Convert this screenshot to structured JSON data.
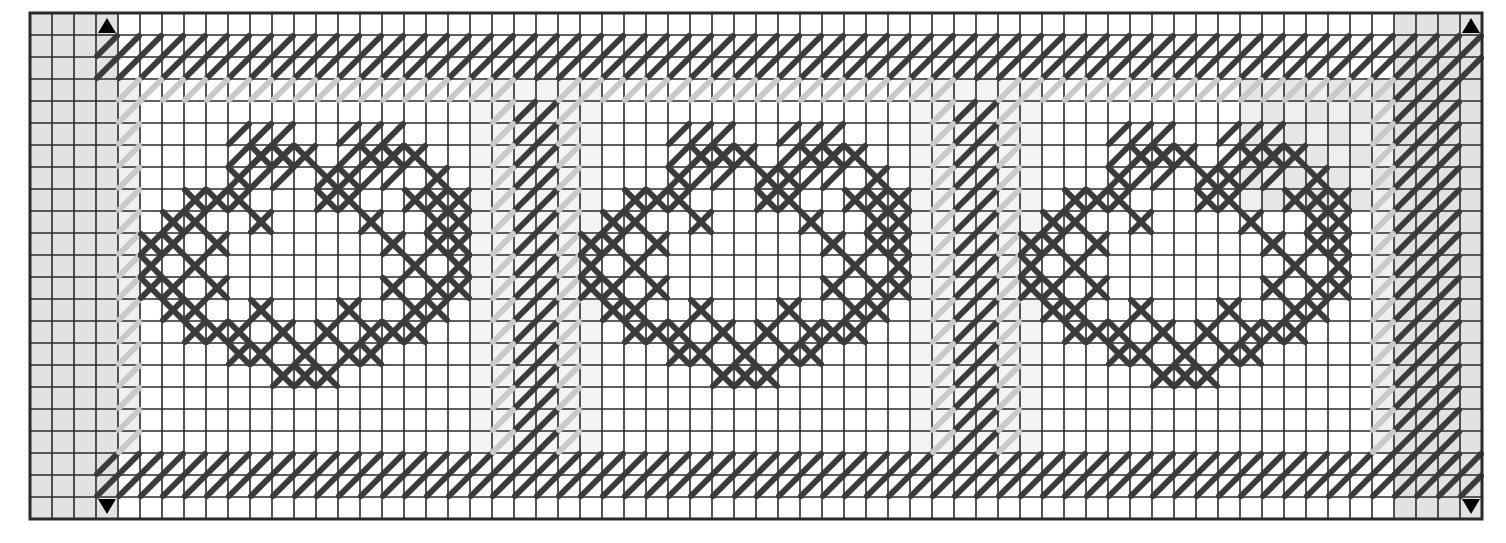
{
  "chart_title": "Needlepoint / Cross-Stitch Pattern Chart",
  "chart_data": {
    "type": "heatmap",
    "subtitle": "Repeating rosette border band with diagonal half-stitch borders",
    "xlabel": "",
    "ylabel": "",
    "grid": true,
    "legend_position": "none",
    "columns": 66,
    "rows": 23,
    "cell_px": 22,
    "origin": {
      "x": 30,
      "y": 13
    },
    "xlim": [
      0,
      66
    ],
    "ylim": [
      0,
      23
    ],
    "tick_labels_x": [],
    "tick_labels_y": [],
    "annotations": [
      {
        "name": "center-marker-top-left",
        "symbol": "triangle-up",
        "col": 3,
        "row": 0,
        "edge": "top"
      },
      {
        "name": "center-marker-top-right",
        "symbol": "triangle-up",
        "col": 65,
        "row": 0,
        "edge": "top"
      },
      {
        "name": "center-marker-bottom-left",
        "symbol": "triangle-up",
        "col": 3,
        "row": 22,
        "edge": "bottom"
      },
      {
        "name": "center-marker-bottom-right",
        "symbol": "triangle-up",
        "col": 65,
        "row": 22,
        "edge": "bottom"
      }
    ],
    "symbols": {
      "half_stitch_slash": {
        "label": "half stitch (/)",
        "color": "#3b3b3b"
      },
      "cross_stitch": {
        "label": "full cross stitch (X)",
        "color": "#3b3b3b"
      },
      "ghost_half_stitch": {
        "label": "faded / optional half stitch",
        "color": "#c9c9c9"
      }
    },
    "palette": {
      "grid_line": "#2a2a2a",
      "stitch_dark": "#3b3b3b",
      "stitch_ghost": "#c9c9c9",
      "shade_margin": "#e2e2e2",
      "shade_light": "#efefef",
      "background": "#ffffff",
      "marker": "#000000"
    },
    "shaded_regions": [
      {
        "name": "left-margin-band",
        "col0": 0,
        "row0": 0,
        "col1": 4,
        "row1": 23,
        "color": "#e2e2e2"
      },
      {
        "name": "right-margin-band",
        "col0": 62,
        "row0": 0,
        "col1": 66,
        "row1": 23,
        "color": "#e2e2e2"
      },
      {
        "name": "left-soft-edge",
        "col0": 4,
        "row0": 3,
        "col1": 5,
        "row1": 20,
        "color": "#efefef"
      },
      {
        "name": "right-soft-edge",
        "col0": 61,
        "row0": 3,
        "col1": 62,
        "row1": 20,
        "color": "#efefef"
      },
      {
        "name": "divider-1-halo",
        "col0": 20,
        "row0": 3,
        "col1": 26,
        "row1": 20,
        "color": "#f4f4f4"
      },
      {
        "name": "divider-2-halo",
        "col0": 40,
        "row0": 3,
        "col1": 46,
        "row1": 20,
        "color": "#f4f4f4"
      },
      {
        "name": "upper-right-checker",
        "col0": 55,
        "row0": 3,
        "col1": 62,
        "row1": 9,
        "color": "#efefef"
      }
    ],
    "bands": [
      {
        "name": "top-border-band",
        "row0": 1,
        "row1": 3,
        "col0": 3,
        "col1": 66,
        "stitch": "half_stitch_slash"
      },
      {
        "name": "bottom-border-band",
        "row0": 20,
        "row1": 22,
        "col0": 3,
        "col1": 66,
        "stitch": "half_stitch_slash"
      },
      {
        "name": "right-border-band",
        "col0": 62,
        "col1": 65,
        "row0": 3,
        "row1": 21,
        "stitch": "half_stitch_slash"
      },
      {
        "name": "divider-band-1",
        "col0": 22,
        "col1": 24,
        "row0": 4,
        "row1": 20,
        "stitch": "half_stitch_slash"
      },
      {
        "name": "divider-band-2",
        "col0": 42,
        "col1": 44,
        "row0": 4,
        "row1": 20,
        "stitch": "half_stitch_slash"
      }
    ],
    "motifs": [
      {
        "name": "rosette-motif-1",
        "center_col": 12.5,
        "center_row": 11.5,
        "width": 13,
        "height": 12
      },
      {
        "name": "rosette-motif-2",
        "center_col": 32.5,
        "center_row": 11.5,
        "width": 13,
        "height": 12
      },
      {
        "name": "rosette-motif-3",
        "center_col": 52.5,
        "center_row": 11.5,
        "width": 13,
        "height": 12
      }
    ],
    "motif_template": {
      "description": "13x12 rosette: outer ring of cross stitches, two diagonal half-stitch 'ear' blocks at top, open center",
      "cross_cells": [
        [
          5,
          1
        ],
        [
          6,
          1
        ],
        [
          7,
          1
        ],
        [
          10,
          1
        ],
        [
          11,
          1
        ],
        [
          12,
          1
        ],
        [
          4,
          2
        ],
        [
          8,
          2
        ],
        [
          9,
          2
        ],
        [
          13,
          2
        ],
        [
          2,
          3
        ],
        [
          3,
          3
        ],
        [
          4,
          3
        ],
        [
          8,
          3
        ],
        [
          9,
          3
        ],
        [
          12,
          3
        ],
        [
          13,
          3
        ],
        [
          14,
          3
        ],
        [
          1,
          4
        ],
        [
          2,
          4
        ],
        [
          5,
          4
        ],
        [
          10,
          4
        ],
        [
          13,
          4
        ],
        [
          14,
          4
        ],
        [
          0,
          5
        ],
        [
          1,
          5
        ],
        [
          3,
          5
        ],
        [
          11,
          5
        ],
        [
          13,
          5
        ],
        [
          14,
          5
        ],
        [
          0,
          6
        ],
        [
          2,
          6
        ],
        [
          12,
          6
        ],
        [
          14,
          6
        ],
        [
          0,
          7
        ],
        [
          1,
          7
        ],
        [
          3,
          7
        ],
        [
          11,
          7
        ],
        [
          13,
          7
        ],
        [
          14,
          7
        ],
        [
          1,
          8
        ],
        [
          2,
          8
        ],
        [
          5,
          8
        ],
        [
          9,
          8
        ],
        [
          12,
          8
        ],
        [
          13,
          8
        ],
        [
          2,
          9
        ],
        [
          3,
          9
        ],
        [
          4,
          9
        ],
        [
          6,
          9
        ],
        [
          8,
          9
        ],
        [
          10,
          9
        ],
        [
          11,
          9
        ],
        [
          12,
          9
        ],
        [
          4,
          10
        ],
        [
          5,
          10
        ],
        [
          7,
          10
        ],
        [
          9,
          10
        ],
        [
          10,
          10
        ],
        [
          6,
          11
        ],
        [
          7,
          11
        ],
        [
          8,
          11
        ]
      ],
      "half_cells": [
        [
          4,
          0
        ],
        [
          5,
          0
        ],
        [
          6,
          0
        ],
        [
          9,
          0
        ],
        [
          10,
          0
        ],
        [
          11,
          0
        ],
        [
          4,
          1
        ],
        [
          5,
          1
        ],
        [
          6,
          1
        ],
        [
          9,
          1
        ],
        [
          10,
          1
        ],
        [
          11,
          1
        ],
        [
          5,
          2
        ],
        [
          6,
          2
        ],
        [
          10,
          2
        ],
        [
          11,
          2
        ]
      ]
    },
    "values_note": "Binary occupancy grid: 1 = stitched cell, 0 = empty canvas"
  },
  "markers": {
    "triangle_glyph": "▲"
  }
}
